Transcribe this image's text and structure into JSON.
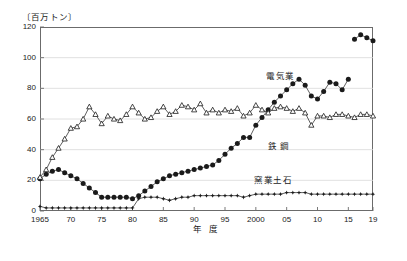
{
  "unit_label": "〔百万トン〕",
  "axis": {
    "x_title": "年  度",
    "y_ticks": [
      "0",
      "20",
      "40",
      "60",
      "80",
      "100",
      "120"
    ],
    "x_ticks": [
      "1965",
      "70",
      "75",
      "80",
      "85",
      "90",
      "95",
      "2000",
      "05",
      "10",
      "15",
      "19"
    ]
  },
  "series_labels": {
    "electric": "電気業",
    "steel": "鉄  鋼",
    "ceramics": "窯業土石"
  },
  "colors": {
    "ink": "#1a1a1a",
    "frame": "#6b6b6b",
    "grid": "#d8d8d8"
  },
  "chart_data": {
    "type": "line",
    "title": "",
    "xlabel": "年  度",
    "ylabel": "百万トン",
    "ylim": [
      0,
      120
    ],
    "xlim": [
      1965,
      2019
    ],
    "grid": true,
    "legend_position": "inline-annotations",
    "x": [
      1965,
      1966,
      1967,
      1968,
      1969,
      1970,
      1971,
      1972,
      1973,
      1974,
      1975,
      1976,
      1977,
      1978,
      1979,
      1980,
      1981,
      1982,
      1983,
      1984,
      1985,
      1986,
      1987,
      1988,
      1989,
      1990,
      1991,
      1992,
      1993,
      1994,
      1995,
      1996,
      1997,
      1998,
      1999,
      2000,
      2001,
      2002,
      2003,
      2004,
      2005,
      2006,
      2007,
      2008,
      2009,
      2010,
      2011,
      2012,
      2013,
      2014,
      2015,
      2016,
      2017,
      2018,
      2019
    ],
    "x_tick_labels": [
      "1965",
      "70",
      "75",
      "80",
      "85",
      "90",
      "95",
      "2000",
      "05",
      "10",
      "15",
      "19"
    ],
    "x_tick_values": [
      1965,
      1970,
      1975,
      1980,
      1985,
      1990,
      1995,
      2000,
      2005,
      2010,
      2015,
      2019
    ],
    "series": [
      {
        "name": "電気業",
        "marker": "filled-circle",
        "values": [
          21,
          24,
          26,
          27,
          25,
          23,
          21,
          18,
          15,
          12,
          9,
          9,
          9,
          9,
          9,
          8,
          10,
          13,
          16,
          19,
          21,
          23,
          24,
          25,
          26,
          27,
          28,
          29,
          30,
          33,
          37,
          41,
          44,
          48,
          48,
          56,
          61,
          66,
          71,
          75,
          79,
          83,
          86,
          82,
          75,
          73,
          78,
          84,
          83,
          79,
          86,
          112,
          115,
          113,
          111
        ]
      },
      {
        "name": "鉄  鋼",
        "marker": "open-triangle",
        "values": [
          22,
          27,
          35,
          41,
          47,
          54,
          55,
          60,
          68,
          63,
          57,
          62,
          60,
          59,
          63,
          68,
          64,
          60,
          61,
          65,
          68,
          63,
          65,
          69,
          68,
          66,
          70,
          64,
          66,
          64,
          66,
          65,
          67,
          62,
          64,
          69,
          66,
          64,
          67,
          68,
          67,
          65,
          67,
          64,
          56,
          62,
          62,
          61,
          63,
          63,
          62,
          61,
          63,
          63,
          62
        ]
      },
      {
        "name": "窯業土石",
        "marker": "star",
        "values": [
          3,
          2,
          2,
          2,
          2,
          2,
          2,
          2,
          2,
          2,
          2,
          2,
          2,
          2,
          2,
          2,
          8,
          9,
          9,
          9,
          8,
          7,
          8,
          9,
          9,
          10,
          10,
          10,
          10,
          10,
          10,
          10,
          10,
          9,
          10,
          11,
          11,
          11,
          11,
          11,
          12,
          12,
          12,
          12,
          11,
          11,
          11,
          11,
          11,
          11,
          11,
          11,
          11,
          11,
          11
        ]
      }
    ]
  }
}
